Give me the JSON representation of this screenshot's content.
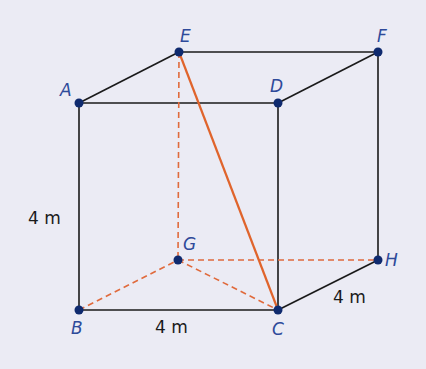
{
  "diagram": {
    "type": "cube",
    "colors": {
      "background": "#ebebf4",
      "edge": "#1a1a1a",
      "hidden": "#e06a3c",
      "diagonal": "#e0642c",
      "vertex": "#0f2a6e",
      "label": "#2e4a9a"
    },
    "vertices": {
      "A": {
        "label": "A",
        "x": 79,
        "y": 103
      },
      "E": {
        "label": "E",
        "x": 179,
        "y": 52
      },
      "D": {
        "label": "D",
        "x": 278,
        "y": 103
      },
      "F": {
        "label": "F",
        "x": 378,
        "y": 52
      },
      "B": {
        "label": "B",
        "x": 79,
        "y": 310
      },
      "G": {
        "label": "G",
        "x": 178,
        "y": 260
      },
      "C": {
        "label": "C",
        "x": 278,
        "y": 310
      },
      "H": {
        "label": "H",
        "x": 378,
        "y": 260
      }
    },
    "dimensions": {
      "height": "4 m",
      "width": "4 m",
      "depth": "4 m"
    }
  }
}
